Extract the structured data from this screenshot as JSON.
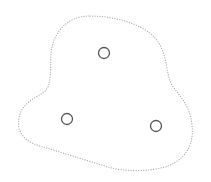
{
  "diagram": {
    "width": 211,
    "height": 182,
    "background": "#ffffff",
    "region": {
      "shape": "blob",
      "stroke": "#a8a8a8",
      "stroke_style": "dotted",
      "path": "M 90 16 C 118 16 150 26 160 45 C 168 60 166 75 172 85 C 180 97 190 105 192 125 C 194 142 188 158 168 166 C 150 172 125 172 108 167 C 85 160 60 152 40 146 C 22 141 17 130 19 118 C 21 104 35 98 44 92 C 52 86 50 70 51 55 C 52 35 65 16 90 16 Z"
    },
    "nodes": [
      {
        "id": "node-top",
        "cx": 104,
        "cy": 53,
        "r": 5.5,
        "stroke": "#555555"
      },
      {
        "id": "node-left",
        "cx": 67,
        "cy": 119,
        "r": 5.5,
        "stroke": "#555555"
      },
      {
        "id": "node-right",
        "cx": 156,
        "cy": 126,
        "r": 5.5,
        "stroke": "#555555"
      }
    ]
  }
}
